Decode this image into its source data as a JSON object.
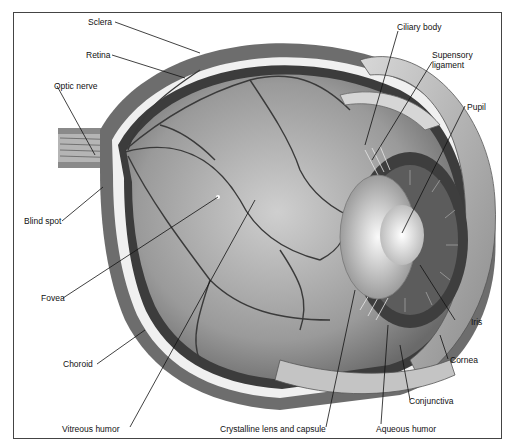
{
  "labels": {
    "sclera": "Sclera",
    "retina": "Retina",
    "optic_nerve": "Optic nerve",
    "blind_spot": "Blind spot",
    "fovea": "Fovea",
    "choroid": "Choroid",
    "vitreous_humor": "Vitreous humor",
    "crystalline_lens": "Crystalline lens and capsule",
    "aqueous_humor": "Aqueous humor",
    "conjunctiva": "Conjunctiva",
    "cornea": "Cornea",
    "iris": "Iris",
    "pupil": "Pupil",
    "suspensory_ligament": "Supensory\nligament",
    "ciliary_body": "Ciliary body"
  },
  "suspensory_line1": "Supensory",
  "suspensory_line2": "ligament"
}
